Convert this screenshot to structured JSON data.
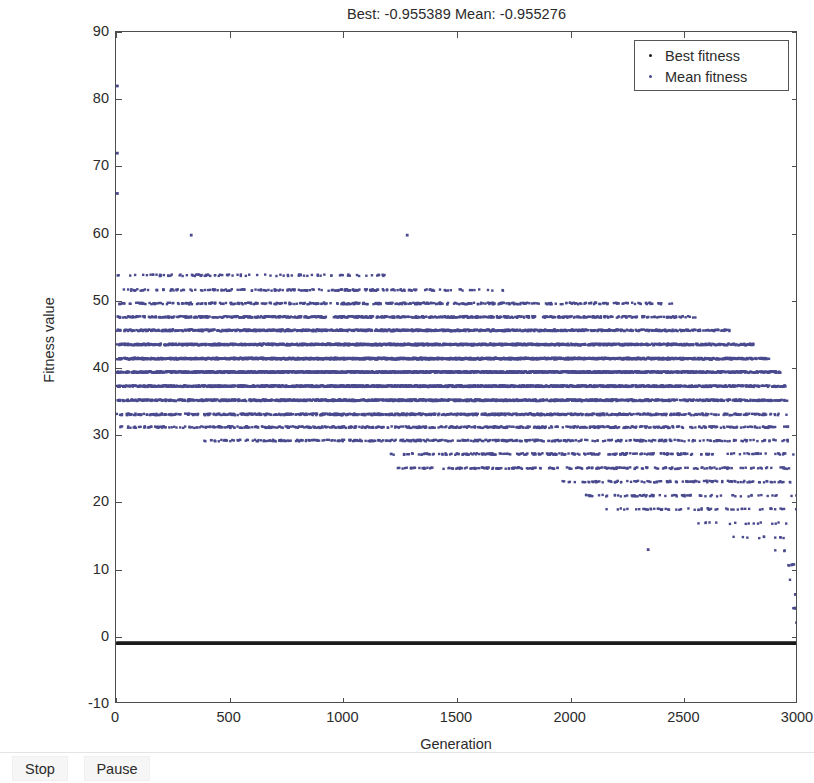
{
  "window": {
    "title_text": "Best: -0.955389 Mean: -0.955276"
  },
  "toolbar": {
    "stop_label": "Stop",
    "pause_label": "Pause"
  },
  "legend": {
    "position": "top-right",
    "entries": [
      {
        "label": "Best fitness",
        "color": "#1a1a1a",
        "marker": "dot"
      },
      {
        "label": "Mean fitness",
        "color": "#4a4a8f",
        "marker": "dot"
      }
    ]
  },
  "axes": {
    "y_label": "Fitness value",
    "x_label": "Generation",
    "y_ticks": [
      "-10",
      "0",
      "10",
      "20",
      "30",
      "40",
      "50",
      "60",
      "70",
      "80",
      "90"
    ],
    "x_ticks": [
      "0",
      "500",
      "1000",
      "1500",
      "2000",
      "2500",
      "3000"
    ]
  },
  "chart_data": {
    "type": "scatter",
    "title": "Best: -0.955389 Mean: -0.955276",
    "xlabel": "Generation",
    "ylabel": "Fitness value",
    "xlim": [
      0,
      3000
    ],
    "ylim": [
      -10,
      90
    ],
    "xticks": [
      0,
      500,
      1000,
      1500,
      2000,
      2500,
      3000
    ],
    "yticks": [
      -10,
      0,
      10,
      20,
      30,
      40,
      50,
      60,
      70,
      80,
      90
    ],
    "grid": false,
    "legend_position": "upper right",
    "best_value": -0.955389,
    "mean_value": -0.955276,
    "series": [
      {
        "name": "Best fitness",
        "color": "#1a1a1a",
        "marker": "dot",
        "description": "Dense near-constant black trace at approximately -0.96 across all 3000 generations",
        "constant_y": -0.955389,
        "x_range": [
          0,
          3000
        ]
      },
      {
        "name": "Mean fitness",
        "color": "#4a4a8f",
        "marker": "dot",
        "description": "Quantized horizontal bands of mean fitness values decaying from ~54 down toward 0 as generations increase; sparse high outliers near generation 0 at 82, 72, 66 and isolated points near 60 at generations 330 and 1280, and a low outlier near 13 at generation 2340",
        "bands": [
          {
            "y": 53.8,
            "x_start": 0,
            "x_end": 1180,
            "density": 0.1
          },
          {
            "y": 51.6,
            "x_start": 0,
            "x_end": 1700,
            "density": 0.14
          },
          {
            "y": 49.6,
            "x_start": 0,
            "x_end": 2450,
            "density": 0.2
          },
          {
            "y": 47.6,
            "x_start": 0,
            "x_end": 2550,
            "density": 0.3
          },
          {
            "y": 45.6,
            "x_start": 0,
            "x_end": 2700,
            "density": 0.42
          },
          {
            "y": 43.5,
            "x_start": 0,
            "x_end": 2800,
            "density": 0.55
          },
          {
            "y": 41.4,
            "x_start": 0,
            "x_end": 2870,
            "density": 0.7
          },
          {
            "y": 39.4,
            "x_start": 0,
            "x_end": 2920,
            "density": 0.72
          },
          {
            "y": 37.3,
            "x_start": 0,
            "x_end": 2940,
            "density": 0.62
          },
          {
            "y": 35.2,
            "x_start": 0,
            "x_end": 2950,
            "density": 0.48
          },
          {
            "y": 33.1,
            "x_start": 0,
            "x_end": 2960,
            "density": 0.34
          },
          {
            "y": 31.2,
            "x_start": 0,
            "x_end": 2965,
            "density": 0.22
          },
          {
            "y": 29.2,
            "x_start": 380,
            "x_end": 2970,
            "density": 0.18
          },
          {
            "y": 27.2,
            "x_start": 1200,
            "x_end": 2975,
            "density": 0.16
          },
          {
            "y": 25.1,
            "x_start": 1230,
            "x_end": 2980,
            "density": 0.13
          },
          {
            "y": 23.1,
            "x_start": 1960,
            "x_end": 2985,
            "density": 0.12
          },
          {
            "y": 21.0,
            "x_start": 2050,
            "x_end": 2988,
            "density": 0.1
          },
          {
            "y": 19.0,
            "x_start": 2150,
            "x_end": 2990,
            "density": 0.07
          },
          {
            "y": 16.9,
            "x_start": 2560,
            "x_end": 2992,
            "density": 0.05
          },
          {
            "y": 14.8,
            "x_start": 2700,
            "x_end": 2994,
            "density": 0.04
          },
          {
            "y": 12.8,
            "x_start": 2860,
            "x_end": 2996,
            "density": 0.04
          },
          {
            "y": 10.7,
            "x_start": 2930,
            "x_end": 2997,
            "density": 0.05
          },
          {
            "y": 8.5,
            "x_start": 2955,
            "x_end": 2998,
            "density": 0.06
          },
          {
            "y": 6.4,
            "x_start": 2965,
            "x_end": 2998,
            "density": 0.07
          },
          {
            "y": 4.3,
            "x_start": 2975,
            "x_end": 2999,
            "density": 0.09
          },
          {
            "y": 2.2,
            "x_start": 2982,
            "x_end": 3000,
            "density": 0.11
          }
        ],
        "outliers": [
          {
            "x": 5,
            "y": 82.0
          },
          {
            "x": 5,
            "y": 72.0
          },
          {
            "x": 5,
            "y": 66.0
          },
          {
            "x": 330,
            "y": 59.8
          },
          {
            "x": 1280,
            "y": 59.8
          },
          {
            "x": 2340,
            "y": 13.0
          }
        ]
      }
    ]
  }
}
